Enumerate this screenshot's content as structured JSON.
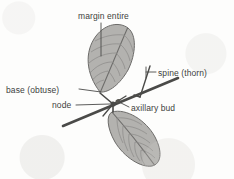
{
  "figure": {
    "background_color": "#fdfdfc",
    "ink_color": "#4a4a48",
    "leaf_fill_color": "#b3b2af",
    "leaf_vein_color": "#8a8987",
    "label_text_color": "#403f3d"
  },
  "labels": {
    "margin_entire": "margin entire",
    "spine_thorn": "spine (thorn)",
    "base_obtuse": "base (obtuse)",
    "node": "node",
    "axillary_bud": "axillary bud"
  },
  "parts": {
    "upper_leaf": "upper-leaf",
    "lower_leaf": "lower-leaf",
    "stem": "stem",
    "thorn": "thorn",
    "node_point": "node",
    "axillary_bud_point": "axillary-bud",
    "upper_petiole": "upper-petiole",
    "lower_petiole": "lower-petiole"
  },
  "leader_lines": {
    "margin_entire": "leader-margin-entire",
    "spine_thorn": "leader-spine-thorn",
    "base_obtuse": "leader-base-obtuse",
    "node": "leader-node",
    "axillary_bud": "leader-axillary-bud"
  }
}
